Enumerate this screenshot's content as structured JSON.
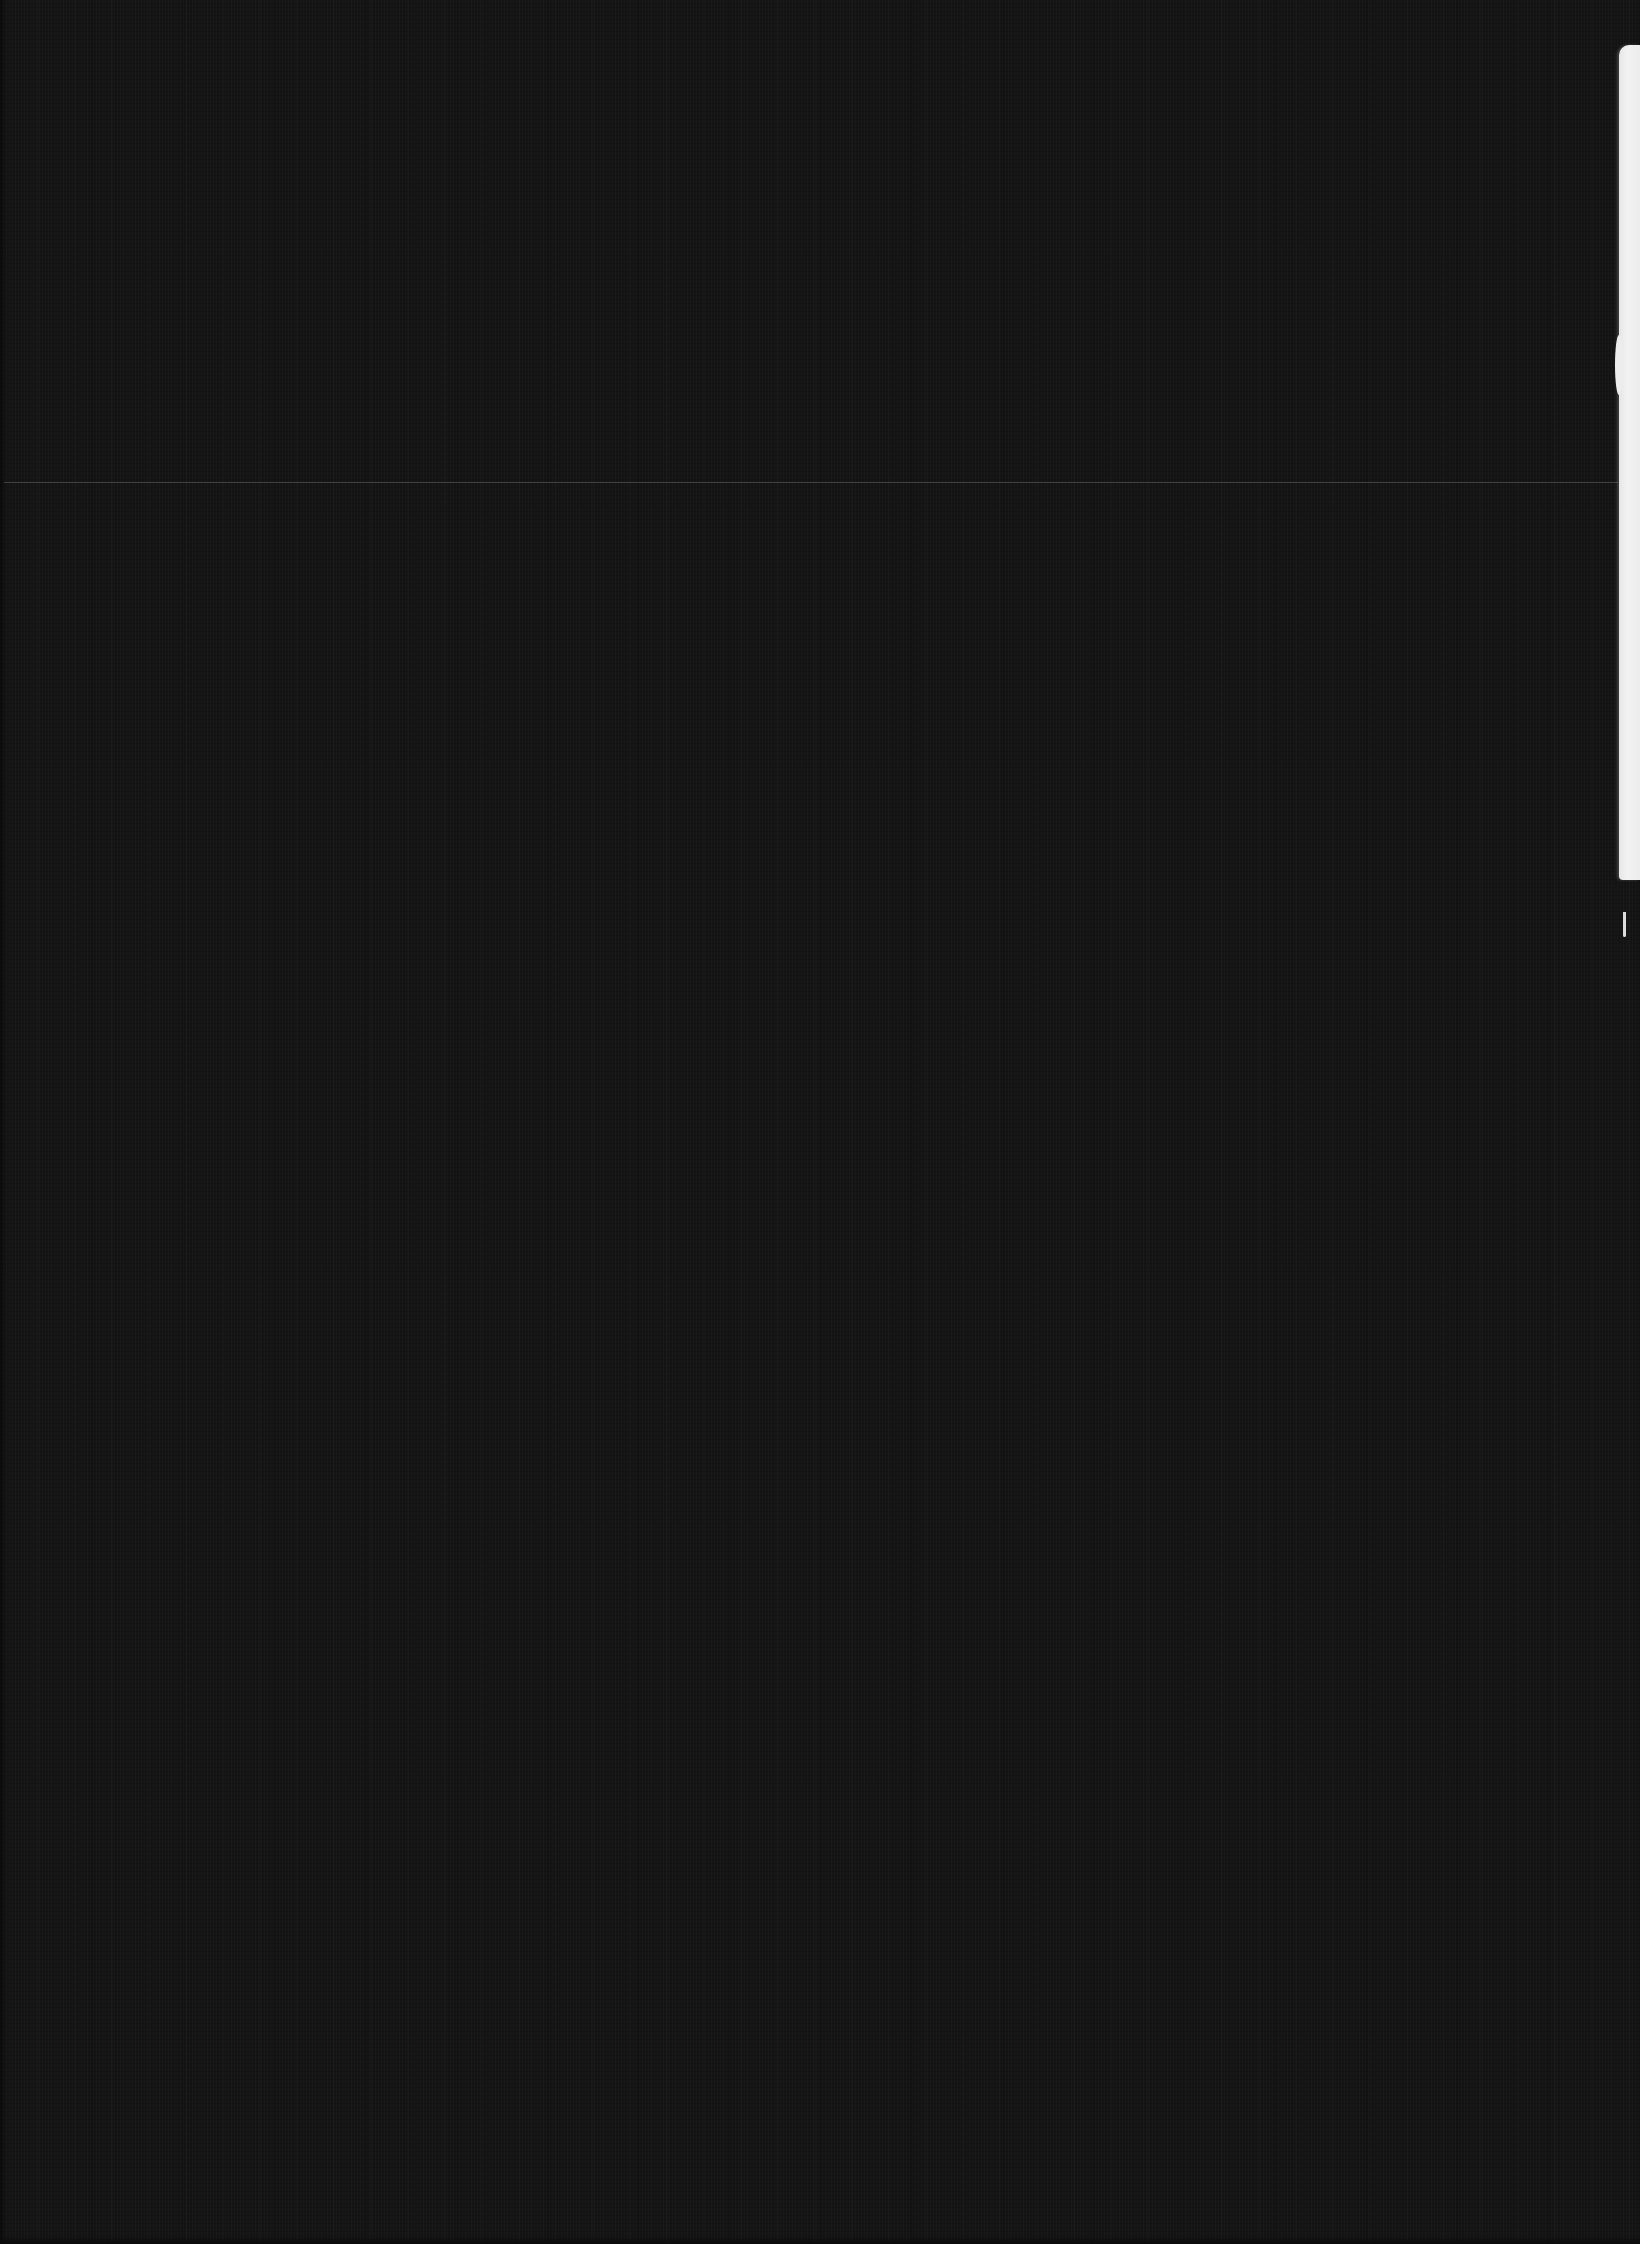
{
  "page": {
    "background_color": "#141414",
    "visible_text": []
  },
  "artifacts": {
    "seam_line": {
      "y": 482,
      "color": "#6e6e6e"
    },
    "paper_strip": {
      "side": "right",
      "top": 45,
      "bottom": 935,
      "color": "#ededed"
    },
    "paper_strip_tail": {
      "top": 912,
      "bottom": 937
    }
  }
}
